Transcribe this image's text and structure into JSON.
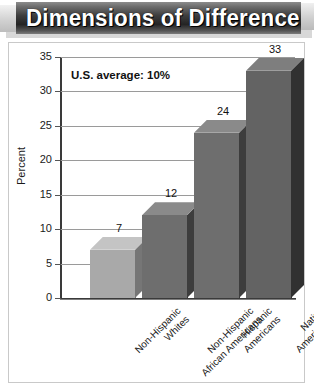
{
  "banner": {
    "title": "Dimensions of Difference"
  },
  "chart_data": {
    "type": "bar",
    "title": "Dimensions of Difference",
    "xlabel": "",
    "ylabel": "Percent",
    "ylim": [
      0,
      35
    ],
    "yticks": [
      0,
      5,
      10,
      15,
      20,
      25,
      30,
      35
    ],
    "ytick_labels": [
      "0",
      "5",
      "10",
      "15",
      "20",
      "25",
      "30",
      "35"
    ],
    "grid": true,
    "legend": "none",
    "annotations": [
      "U.S. average: 10%"
    ],
    "categories": [
      "Non-Hispanic\nWhites",
      "Non-Hispanic\nAfrican Americans",
      "Hispanic\nAmericans",
      "Native\nAmericans"
    ],
    "category_lines": [
      [
        "Non-Hispanic",
        "Whites"
      ],
      [
        "Non-Hispanic",
        "African Americans"
      ],
      [
        "Hispanic",
        "Americans"
      ],
      [
        "Native",
        "Americans"
      ]
    ],
    "values": [
      7,
      12,
      24,
      33
    ],
    "value_labels": [
      "7",
      "12",
      "24",
      "33"
    ],
    "bar_colors": [
      "#a9a9a9",
      "#6e6e6e",
      "#6e6e6e",
      "#636363"
    ],
    "bar_side_colors": [
      "#767676",
      "#3d3d3d",
      "#3d3d3d",
      "#313131"
    ],
    "bar_top_colors": [
      "#c4c4c4",
      "#8a8a8a",
      "#8a8a8a",
      "#7e7e7e"
    ]
  },
  "colors": {
    "banner_dark": "#242424",
    "banner_light": "#d2d2d2",
    "frame_border": "#c9c9c9",
    "axis": "#3a3a3a",
    "gridline": "#9a9a9a",
    "text": "#111111"
  }
}
